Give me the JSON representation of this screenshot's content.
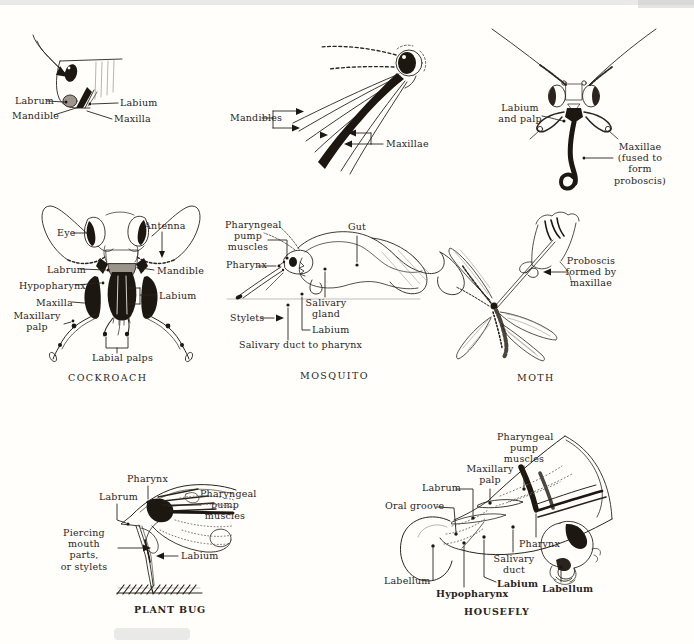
{
  "figure": {
    "ink_color": "#241f19",
    "paper_color": "#fffefb",
    "panels": {
      "chewing_insect": {
        "labels": {
          "labrum": "Labrum",
          "mandible": "Mandible",
          "labium": "Labium",
          "maxilla": "Maxilla"
        }
      },
      "mosquito_head": {
        "labels": {
          "mandibles": "Mandibles",
          "maxillae": "Maxillae"
        }
      },
      "moth_head": {
        "labels": {
          "labium_and_palp": "Labium\nand palp",
          "maxillae_fused": "Maxillae\n(fused to form\nproboscis)"
        }
      },
      "cockroach": {
        "caption": "COCKROACH",
        "labels": {
          "eye": "Eye",
          "antenna": "Antenna",
          "labrum": "Labrum",
          "mandible": "Mandible",
          "hypopharynx": "Hypopharynx",
          "labium": "Labium",
          "maxilla": "Maxilla",
          "maxillary_palp": "Maxillary\npalp",
          "labial_palps": "Labial palps"
        }
      },
      "mosquito": {
        "caption": "MOSQUITO",
        "labels": {
          "pharyngeal_pump_muscles": "Pharyngeal\npump\nmuscles",
          "pharynx": "Pharynx",
          "gut": "Gut",
          "salivary_gland": "Salivary\ngland",
          "stylets": "Stylets",
          "labium": "Labium",
          "salivary_duct_to_pharynx": "Salivary duct to pharynx"
        }
      },
      "moth": {
        "caption": "MOTH",
        "labels": {
          "proboscis": "Proboscis\nformed by\nmaxillae"
        }
      },
      "plant_bug": {
        "caption": "PLANT BUG",
        "labels": {
          "pharynx": "Pharynx",
          "labrum": "Labrum",
          "pharyngeal_pump_muscles": "Pharyngeal\npump\nmuscles",
          "piercing_mouth_parts": "Piercing\nmouth parts,\nor stylets",
          "labium": "Labium"
        }
      },
      "housefly": {
        "caption": "HOUSEFLY",
        "labels": {
          "pharyngeal_pump_muscles": "Pharyngeal\npump\nmuscles",
          "maxillary_palp": "Maxillary\npalp",
          "labrum": "Labrum",
          "oral_groove": "Oral groove",
          "pharynx": "Pharynx",
          "salivary_duct": "Salivary\nduct",
          "labellum_left": "Labellum",
          "hypopharynx": "Hypopharynx",
          "labium": "Labium",
          "labellum_right": "Labellum"
        }
      }
    }
  }
}
